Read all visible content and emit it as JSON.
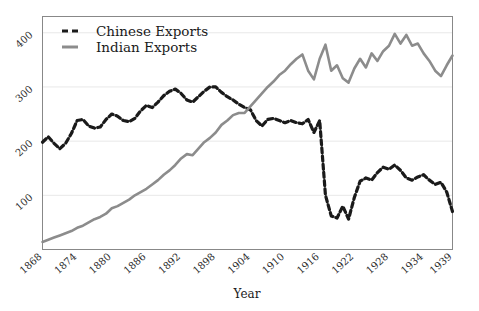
{
  "chart_data": {
    "type": "line",
    "title": "",
    "xlabel": "Year",
    "ylabel": "",
    "xlim": [
      1868,
      1939
    ],
    "ylim": [
      0,
      430
    ],
    "grid": true,
    "legend_position": "top-left",
    "xticks": [
      "1868",
      "1874",
      "1880",
      "1886",
      "1892",
      "1898",
      "1904",
      "1910",
      "1916",
      "1922",
      "1928",
      "1934",
      "1939"
    ],
    "xtick_values": [
      1868,
      1874,
      1880,
      1886,
      1892,
      1898,
      1904,
      1910,
      1916,
      1922,
      1928,
      1934,
      1939
    ],
    "yticks": [
      "100",
      "200",
      "300",
      "400"
    ],
    "ytick_values": [
      100,
      200,
      300,
      400
    ],
    "series": [
      {
        "name": "Chinese Exports",
        "color": "#1a1a1a",
        "style": "dashed",
        "x": [
          1868,
          1869,
          1870,
          1871,
          1872,
          1873,
          1874,
          1875,
          1876,
          1877,
          1878,
          1879,
          1880,
          1881,
          1882,
          1883,
          1884,
          1885,
          1886,
          1887,
          1888,
          1889,
          1890,
          1891,
          1892,
          1893,
          1894,
          1895,
          1896,
          1897,
          1898,
          1899,
          1900,
          1901,
          1902,
          1903,
          1904,
          1905,
          1906,
          1907,
          1908,
          1909,
          1910,
          1911,
          1912,
          1913,
          1914,
          1915,
          1916,
          1917,
          1918,
          1919,
          1920,
          1921,
          1922,
          1923,
          1924,
          1925,
          1926,
          1927,
          1928,
          1929,
          1930,
          1931,
          1932,
          1933,
          1934,
          1935,
          1936,
          1937,
          1938,
          1939
        ],
        "values": [
          198,
          208,
          196,
          186,
          196,
          214,
          238,
          240,
          228,
          224,
          226,
          240,
          250,
          246,
          238,
          236,
          242,
          256,
          266,
          262,
          272,
          284,
          292,
          296,
          288,
          276,
          272,
          282,
          292,
          300,
          300,
          290,
          282,
          276,
          268,
          262,
          258,
          238,
          228,
          240,
          242,
          238,
          234,
          238,
          234,
          232,
          240,
          216,
          238,
          100,
          62,
          58,
          80,
          56,
          96,
          126,
          132,
          128,
          142,
          152,
          148,
          156,
          146,
          132,
          128,
          134,
          138,
          128,
          120,
          124,
          106,
          70
        ],
        "note": "black dashed line"
      },
      {
        "name": "Indian Exports",
        "color": "#8c8c8c",
        "style": "solid",
        "x": [
          1868,
          1869,
          1870,
          1871,
          1872,
          1873,
          1874,
          1875,
          1876,
          1877,
          1878,
          1879,
          1880,
          1881,
          1882,
          1883,
          1884,
          1885,
          1886,
          1887,
          1888,
          1889,
          1890,
          1891,
          1892,
          1893,
          1894,
          1895,
          1896,
          1897,
          1898,
          1899,
          1900,
          1901,
          1902,
          1903,
          1904,
          1905,
          1906,
          1907,
          1908,
          1909,
          1910,
          1911,
          1912,
          1913,
          1914,
          1915,
          1916,
          1917,
          1918,
          1919,
          1920,
          1921,
          1922,
          1923,
          1924,
          1925,
          1926,
          1927,
          1928,
          1929,
          1930,
          1931,
          1932,
          1933,
          1934,
          1935,
          1936,
          1937,
          1938,
          1939
        ],
        "values": [
          14,
          18,
          22,
          26,
          30,
          34,
          40,
          44,
          50,
          56,
          60,
          66,
          76,
          80,
          86,
          92,
          100,
          106,
          112,
          120,
          128,
          138,
          146,
          156,
          168,
          176,
          174,
          186,
          198,
          206,
          216,
          230,
          238,
          248,
          252,
          252,
          264,
          276,
          288,
          300,
          310,
          322,
          330,
          342,
          352,
          360,
          330,
          314,
          352,
          378,
          330,
          340,
          316,
          308,
          334,
          352,
          336,
          362,
          348,
          366,
          376,
          398,
          380,
          396,
          376,
          380,
          362,
          348,
          330,
          320,
          340,
          358
        ],
        "note": "gray solid line"
      }
    ]
  },
  "legend": {
    "entries": [
      {
        "label": "Chinese Exports",
        "swatch": "dashed-black"
      },
      {
        "label": "Indian Exports",
        "swatch": "solid-gray"
      }
    ]
  },
  "axes": {
    "x_title": "Year"
  },
  "colors": {
    "chinese": "#1a1a1a",
    "indian": "#8c8c8c",
    "grid": "#e8e8e8",
    "frame": "#888888",
    "background": "#ffffff"
  }
}
